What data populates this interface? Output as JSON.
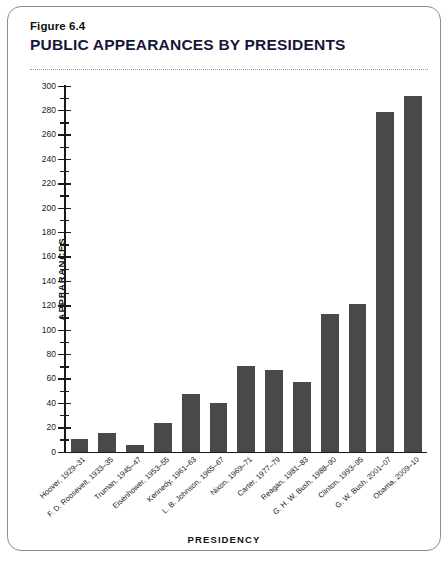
{
  "figure": {
    "number": "Figure 6.4",
    "title": "PUBLIC APPEARANCES BY PRESIDENTS"
  },
  "chart_data": {
    "type": "bar",
    "title": "PUBLIC APPEARANCES BY PRESIDENTS",
    "xlabel": "PRESIDENCY",
    "ylabel": "APPEARANCES",
    "ylim": [
      0,
      300
    ],
    "y_major_step": 20,
    "y_minor_step": 10,
    "grid": false,
    "legend": null,
    "bar_color": "#494949",
    "categories": [
      "Hoover, 1929–31",
      "F. D. Roosevelt, 1933–35",
      "Truman, 1945–47",
      "Eisenhower, 1953–55",
      "Kennedy, 1961–63",
      "L. B. Johnson, 1965–67",
      "Nixon, 1969–71",
      "Carter, 1977–79",
      "Reagan, 1981–83",
      "G. H. W. Bush, 1988–90",
      "Clinton, 1993–95",
      "G. W. Bush, 2001–07",
      "Obama, 2009–10"
    ],
    "values": [
      10,
      15,
      5,
      23,
      47,
      40,
      70,
      67,
      57,
      113,
      121,
      278,
      291
    ],
    "y_tick_labels": [
      "0",
      "20",
      "40",
      "60",
      "80",
      "100",
      "120",
      "140",
      "160",
      "180",
      "200",
      "220",
      "240",
      "260",
      "280",
      "300"
    ]
  }
}
